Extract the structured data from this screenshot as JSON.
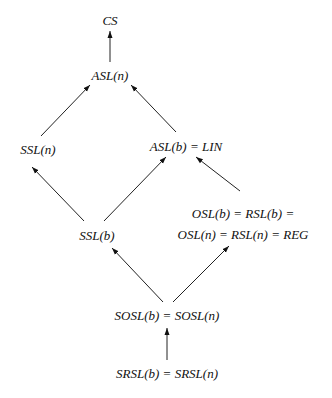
{
  "diagram": {
    "type": "hierarchy",
    "nodes": [
      {
        "id": "cs",
        "label": "CS"
      },
      {
        "id": "asl_n",
        "label": "ASL(n)"
      },
      {
        "id": "ssl_n",
        "label": "SSL(n)"
      },
      {
        "id": "asl_b",
        "label": "ASL(b) = LIN"
      },
      {
        "id": "ssl_b",
        "label": "SSL(b)"
      },
      {
        "id": "osl",
        "label_line1": "OSL(b) = RSL(b) =",
        "label_line2": "OSL(n) = RSL(n) = REG"
      },
      {
        "id": "sosl",
        "label": "SOSL(b) = SOSL(n)"
      },
      {
        "id": "srsl",
        "label": "SRSL(b) = SRSL(n)"
      }
    ],
    "edges": [
      {
        "from": "asl_n",
        "to": "cs"
      },
      {
        "from": "ssl_n",
        "to": "asl_n"
      },
      {
        "from": "asl_b",
        "to": "asl_n"
      },
      {
        "from": "ssl_b",
        "to": "ssl_n"
      },
      {
        "from": "ssl_b",
        "to": "asl_b"
      },
      {
        "from": "osl",
        "to": "asl_b"
      },
      {
        "from": "sosl",
        "to": "ssl_b"
      },
      {
        "from": "sosl",
        "to": "osl"
      },
      {
        "from": "srsl",
        "to": "sosl"
      }
    ]
  }
}
